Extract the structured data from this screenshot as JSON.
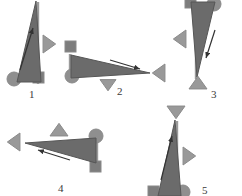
{
  "figure": {
    "title": "",
    "background_color": "#ffffff",
    "panel_count": 5,
    "colors": {
      "body_fill": "#6b6b6b",
      "body_stroke": "#565656",
      "marker_fill": "#999999",
      "marker_stroke": "#8a8a8a",
      "circle_fill": "#8f8f8f",
      "square_fill": "#7d7d7d",
      "arrow_color": "#333333",
      "pole_color": "#9a9a9a",
      "label_color": "#3a3a3a"
    },
    "panels": [
      {
        "label": "1",
        "label_x": 29,
        "label_y": 89,
        "orientation": "upright",
        "body": {
          "shape": "slender-triangle",
          "apex": [
            36,
            1
          ],
          "base_left": [
            17,
            82
          ],
          "base_right": [
            41,
            82
          ]
        },
        "pole": {
          "x1": 38,
          "y1": 2,
          "x2": 38,
          "y2": 84
        },
        "circle": {
          "cx": 14,
          "cy": 79,
          "r": 7
        },
        "square": {
          "x": 33,
          "y": 72,
          "w": 11,
          "h": 11
        },
        "marker_triangle": {
          "direction": "right",
          "cx": 48,
          "cy": 44,
          "size": 9
        },
        "arrow": {
          "from": [
            20,
            70
          ],
          "to": [
            33,
            28
          ],
          "direction": "up-left"
        }
      },
      {
        "label": "2",
        "label_x": 117,
        "label_y": 86,
        "orientation": "right",
        "body": {
          "shape": "slender-triangle",
          "apex": [
            150,
            73
          ],
          "base_left": [
            71,
            55
          ],
          "base_right": [
            71,
            78
          ]
        },
        "pole": {
          "x1": 70,
          "y1": 54,
          "x2": 70,
          "y2": 78
        },
        "circle": {
          "cx": 72,
          "cy": 76,
          "r": 7
        },
        "square": {
          "x": 65,
          "y": 41,
          "w": 11,
          "h": 11
        },
        "marker_triangle": {
          "direction": "left",
          "cx": 160,
          "cy": 73,
          "size": 9
        },
        "marker_triangle_2": {
          "direction": "down",
          "cx": 108,
          "cy": 84,
          "size": 8
        },
        "arrow": {
          "from": [
            110,
            60
          ],
          "to": [
            140,
            69
          ],
          "direction": "right"
        }
      },
      {
        "label": "3",
        "label_x": 211,
        "label_y": 89,
        "orientation": "inverted",
        "body": {
          "shape": "slender-triangle",
          "apex": [
            197,
            77
          ],
          "base_left": [
            191,
            2
          ],
          "base_right": [
            215,
            2
          ]
        },
        "pole": {
          "x1": 196,
          "y1": 2,
          "x2": 196,
          "y2": 79
        },
        "circle": {
          "cx": 214,
          "cy": 4,
          "r": 7
        },
        "square": {
          "x": 185,
          "y": -3,
          "w": 11,
          "h": 11
        },
        "marker_triangle": {
          "direction": "left",
          "cx": 181,
          "cy": 39,
          "size": 9
        },
        "marker_triangle_2": {
          "direction": "up",
          "cx": 198,
          "cy": 84,
          "size": 9
        },
        "arrow": {
          "from": [
            215,
            30
          ],
          "to": [
            206,
            58
          ],
          "direction": "down"
        }
      },
      {
        "label": "4",
        "label_x": 58,
        "label_y": 183,
        "orientation": "left",
        "body": {
          "shape": "slender-triangle",
          "apex": [
            25,
            143
          ],
          "base_left": [
            96,
            138
          ],
          "base_right": [
            96,
            163
          ]
        },
        "pole": {
          "x1": 97,
          "y1": 137,
          "x2": 97,
          "y2": 164
        },
        "circle": {
          "cx": 96,
          "cy": 136,
          "r": 7
        },
        "square": {
          "x": 90,
          "y": 161,
          "w": 11,
          "h": 11
        },
        "marker_triangle": {
          "direction": "left",
          "cx": 15,
          "cy": 142,
          "size": 9
        },
        "marker_triangle_2": {
          "direction": "up",
          "cx": 59,
          "cy": 131,
          "size": 9
        },
        "arrow": {
          "from": [
            70,
            160
          ],
          "to": [
            38,
            150
          ],
          "direction": "left"
        }
      },
      {
        "label": "5",
        "label_x": 202,
        "label_y": 185,
        "orientation": "upright",
        "body": {
          "shape": "slender-triangle",
          "apex": [
            175,
            120
          ],
          "base_left": [
            158,
            196
          ],
          "base_right": [
            181,
            196
          ]
        },
        "pole": {
          "x1": 177,
          "y1": 121,
          "x2": 177,
          "y2": 196
        },
        "circle": {
          "cx": 183,
          "cy": 192,
          "r": 7
        },
        "square": {
          "x": 148,
          "y": 186,
          "w": 11,
          "h": 11
        },
        "marker_triangle": {
          "direction": "right",
          "cx": 188,
          "cy": 156,
          "size": 9
        },
        "marker_triangle_2": {
          "direction": "down",
          "cx": 176,
          "cy": 111,
          "size": 9
        },
        "arrow": {
          "from": [
            161,
            180
          ],
          "to": [
            172,
            136
          ],
          "direction": "up-left"
        }
      }
    ]
  }
}
